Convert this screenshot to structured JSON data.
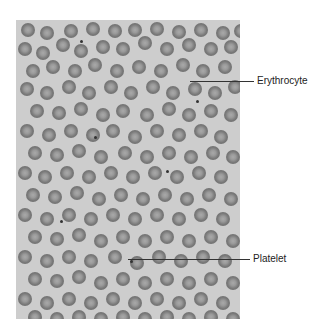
{
  "figure": {
    "background_color": "#cdcdcd",
    "cell_color": "#777777",
    "labels": [
      {
        "id": "erythrocyte",
        "text": "Erythrocyte",
        "line_x1": 190,
        "line_x2": 254,
        "y": 81,
        "text_x": 257
      },
      {
        "id": "platelet",
        "text": "Platelet",
        "line_x1": 128,
        "line_x2": 250,
        "y": 259,
        "text_x": 253
      }
    ],
    "cells": [
      [
        5,
        3,
        14
      ],
      [
        24,
        6,
        14
      ],
      [
        48,
        4,
        14
      ],
      [
        70,
        2,
        14
      ],
      [
        92,
        4,
        14
      ],
      [
        112,
        3,
        14
      ],
      [
        134,
        2,
        14
      ],
      [
        156,
        5,
        14
      ],
      [
        178,
        3,
        14
      ],
      [
        200,
        6,
        14
      ],
      [
        218,
        4,
        14
      ],
      [
        2,
        22,
        14
      ],
      [
        20,
        26,
        14
      ],
      [
        40,
        18,
        14
      ],
      [
        58,
        24,
        14
      ],
      [
        80,
        20,
        14
      ],
      [
        100,
        22,
        14
      ],
      [
        122,
        16,
        14
      ],
      [
        144,
        22,
        14
      ],
      [
        166,
        18,
        14
      ],
      [
        188,
        22,
        14
      ],
      [
        208,
        20,
        14
      ],
      [
        10,
        44,
        14
      ],
      [
        30,
        40,
        14
      ],
      [
        52,
        44,
        14
      ],
      [
        72,
        38,
        14
      ],
      [
        94,
        44,
        14
      ],
      [
        116,
        40,
        14
      ],
      [
        138,
        44,
        14
      ],
      [
        160,
        38,
        14
      ],
      [
        180,
        44,
        14
      ],
      [
        202,
        40,
        14
      ],
      [
        4,
        62,
        14
      ],
      [
        24,
        66,
        14
      ],
      [
        46,
        60,
        14
      ],
      [
        66,
        66,
        14
      ],
      [
        88,
        60,
        14
      ],
      [
        108,
        66,
        14
      ],
      [
        130,
        60,
        14
      ],
      [
        150,
        66,
        14
      ],
      [
        172,
        62,
        14
      ],
      [
        192,
        66,
        14
      ],
      [
        212,
        60,
        14
      ],
      [
        14,
        84,
        14
      ],
      [
        36,
        86,
        14
      ],
      [
        58,
        82,
        14
      ],
      [
        80,
        88,
        14
      ],
      [
        100,
        84,
        14
      ],
      [
        124,
        88,
        14
      ],
      [
        146,
        82,
        14
      ],
      [
        166,
        88,
        14
      ],
      [
        188,
        84,
        14
      ],
      [
        208,
        88,
        14
      ],
      [
        4,
        104,
        14
      ],
      [
        26,
        108,
        14
      ],
      [
        48,
        104,
        14
      ],
      [
        70,
        108,
        14
      ],
      [
        90,
        104,
        14
      ],
      [
        112,
        110,
        14
      ],
      [
        134,
        104,
        14
      ],
      [
        156,
        108,
        14
      ],
      [
        178,
        104,
        14
      ],
      [
        198,
        110,
        14
      ],
      [
        12,
        126,
        14
      ],
      [
        34,
        128,
        14
      ],
      [
        56,
        124,
        14
      ],
      [
        78,
        130,
        14
      ],
      [
        102,
        126,
        14
      ],
      [
        124,
        130,
        14
      ],
      [
        146,
        126,
        14
      ],
      [
        168,
        130,
        14
      ],
      [
        190,
        126,
        14
      ],
      [
        210,
        130,
        14
      ],
      [
        2,
        146,
        14
      ],
      [
        22,
        150,
        14
      ],
      [
        44,
        146,
        14
      ],
      [
        66,
        150,
        14
      ],
      [
        88,
        146,
        14
      ],
      [
        110,
        150,
        14
      ],
      [
        132,
        146,
        14
      ],
      [
        154,
        150,
        14
      ],
      [
        176,
        146,
        14
      ],
      [
        198,
        150,
        14
      ],
      [
        10,
        168,
        14
      ],
      [
        32,
        170,
        14
      ],
      [
        54,
        166,
        14
      ],
      [
        76,
        172,
        14
      ],
      [
        98,
        168,
        14
      ],
      [
        120,
        172,
        14
      ],
      [
        142,
        168,
        14
      ],
      [
        164,
        172,
        14
      ],
      [
        186,
        168,
        14
      ],
      [
        208,
        172,
        14
      ],
      [
        2,
        188,
        14
      ],
      [
        24,
        192,
        14
      ],
      [
        46,
        188,
        14
      ],
      [
        68,
        192,
        14
      ],
      [
        90,
        188,
        14
      ],
      [
        112,
        192,
        14
      ],
      [
        134,
        188,
        14
      ],
      [
        156,
        192,
        14
      ],
      [
        178,
        188,
        14
      ],
      [
        200,
        192,
        14
      ],
      [
        12,
        210,
        14
      ],
      [
        34,
        212,
        14
      ],
      [
        56,
        208,
        14
      ],
      [
        78,
        214,
        14
      ],
      [
        100,
        210,
        14
      ],
      [
        122,
        214,
        14
      ],
      [
        144,
        210,
        14
      ],
      [
        166,
        214,
        14
      ],
      [
        188,
        210,
        14
      ],
      [
        210,
        214,
        14
      ],
      [
        2,
        230,
        14
      ],
      [
        24,
        234,
        14
      ],
      [
        46,
        230,
        14
      ],
      [
        68,
        234,
        14
      ],
      [
        92,
        230,
        14
      ],
      [
        114,
        236,
        14
      ],
      [
        136,
        230,
        14
      ],
      [
        158,
        234,
        14
      ],
      [
        180,
        230,
        14
      ],
      [
        202,
        234,
        14
      ],
      [
        12,
        252,
        14
      ],
      [
        34,
        254,
        14
      ],
      [
        56,
        250,
        14
      ],
      [
        78,
        256,
        14
      ],
      [
        100,
        252,
        14
      ],
      [
        122,
        256,
        14
      ],
      [
        144,
        252,
        14
      ],
      [
        166,
        256,
        14
      ],
      [
        188,
        252,
        14
      ],
      [
        210,
        256,
        14
      ],
      [
        2,
        272,
        14
      ],
      [
        24,
        276,
        14
      ],
      [
        46,
        272,
        14
      ],
      [
        68,
        276,
        14
      ],
      [
        90,
        272,
        14
      ],
      [
        112,
        276,
        14
      ],
      [
        134,
        272,
        14
      ],
      [
        156,
        276,
        14
      ],
      [
        178,
        272,
        14
      ],
      [
        200,
        276,
        14
      ],
      [
        12,
        290,
        14
      ],
      [
        34,
        292,
        14
      ],
      [
        56,
        290,
        14
      ],
      [
        78,
        292,
        14
      ],
      [
        100,
        290,
        14
      ],
      [
        122,
        292,
        14
      ],
      [
        144,
        290,
        14
      ],
      [
        166,
        292,
        14
      ],
      [
        188,
        290,
        14
      ],
      [
        210,
        292,
        14
      ]
    ],
    "dots": [
      [
        64,
        20
      ],
      [
        78,
        116
      ],
      [
        114,
        240
      ],
      [
        228,
        260
      ],
      [
        226,
        180
      ],
      [
        180,
        80
      ],
      [
        44,
        200
      ],
      [
        150,
        150
      ]
    ]
  }
}
